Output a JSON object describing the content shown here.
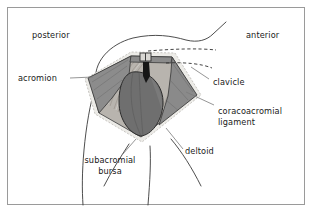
{
  "figure": {
    "background_color": "#ffffff",
    "frame_color": "#9a9a9a",
    "ink_color": "#1a1a1a"
  },
  "orientation_labels": [
    {
      "id": "posterior",
      "text": "posterior",
      "x": 32,
      "y": 30
    },
    {
      "id": "anterior",
      "text": "anterior",
      "x": 246,
      "y": 30
    }
  ],
  "structure_labels": [
    {
      "id": "acromion",
      "text": "acromion",
      "x": 18,
      "y": 74
    },
    {
      "id": "clavicle",
      "text": "clavicle",
      "x": 213,
      "y": 82
    },
    {
      "id": "coracoacromial-ligament",
      "text": "coracoacromial\nligament",
      "x": 218,
      "y": 110
    },
    {
      "id": "deltoid",
      "text": "deltoid",
      "x": 185,
      "y": 151
    },
    {
      "id": "subacromial-bursa",
      "text": "subacromial\nbursa",
      "x": 79,
      "y": 160
    }
  ],
  "anatomy_parts": [
    {
      "id": "acromion-wing",
      "name": "acromion",
      "fill": "#8e8e8e"
    },
    {
      "id": "coracoacromial-ligament-body",
      "name": "coracoacromial ligament",
      "fill": "#b4b0ab"
    },
    {
      "id": "humeral-head",
      "name": "humeral head",
      "fill": "#6f6f6f"
    },
    {
      "id": "subacromial-bursa-rim",
      "name": "subacromial bursa",
      "fill": "#e8e6e2"
    },
    {
      "id": "clavicle-dashed",
      "name": "clavicle",
      "fill": "none"
    },
    {
      "id": "deltoid-outline",
      "name": "deltoid",
      "fill": "none"
    },
    {
      "id": "skin-contour",
      "name": "skin contour",
      "fill": "none"
    }
  ],
  "colors": {
    "acromion": "#8e8e8e",
    "ligament": "#b4b0ab",
    "humeral_head": "#6f6f6f",
    "bursa": "#e8e6e2",
    "outline": "#333333"
  }
}
